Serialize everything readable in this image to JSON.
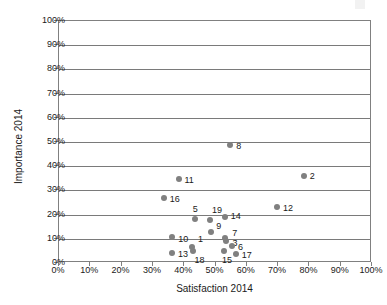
{
  "chart_data": {
    "type": "scatter",
    "title": "",
    "xlabel": "Satisfaction 2014",
    "ylabel": "Importance 2014",
    "xlim": [
      0,
      100
    ],
    "ylim": [
      0,
      100
    ],
    "grid": "horizontal",
    "legend": "none",
    "marker_color": "#808080",
    "xticks": [
      "0%",
      "10%",
      "20%",
      "30%",
      "40%",
      "50%",
      "60%",
      "70%",
      "80%",
      "90%",
      "100%"
    ],
    "xtick_values": [
      0,
      10,
      20,
      30,
      40,
      50,
      60,
      70,
      80,
      90,
      100
    ],
    "yticks": [
      "0%",
      "10%",
      "20%",
      "30%",
      "40%",
      "50%",
      "60%",
      "70%",
      "80%",
      "90%",
      "100%"
    ],
    "ytick_values": [
      0,
      10,
      20,
      30,
      40,
      50,
      60,
      70,
      80,
      90,
      100
    ],
    "points": [
      {
        "label": "1",
        "x": 42.8,
        "y": 6.2,
        "lx": 6,
        "ly": -12
      },
      {
        "label": "2",
        "x": 78.5,
        "y": 35.4,
        "lx": 6,
        "ly": -4
      },
      {
        "label": "3",
        "x": 53.8,
        "y": 8.8,
        "lx": 6,
        "ly": -2
      },
      {
        "label": "5",
        "x": 43.7,
        "y": 17.6,
        "lx": -2,
        "ly": -14
      },
      {
        "label": "6",
        "x": 55.6,
        "y": 6.8,
        "lx": 6,
        "ly": -3
      },
      {
        "label": "7",
        "x": 53.4,
        "y": 10.0,
        "lx": 7,
        "ly": -9
      },
      {
        "label": "8",
        "x": 55.0,
        "y": 48.5,
        "lx": 6,
        "ly": -3
      },
      {
        "label": "9",
        "x": 49.0,
        "y": 12.5,
        "lx": 5,
        "ly": -10
      },
      {
        "label": "10",
        "x": 36.5,
        "y": 10.5,
        "lx": 6,
        "ly": -2
      },
      {
        "label": "11",
        "x": 38.5,
        "y": 34.5,
        "lx": 6,
        "ly": -3
      },
      {
        "label": "12",
        "x": 70.0,
        "y": 22.8,
        "lx": 6,
        "ly": -3
      },
      {
        "label": "13",
        "x": 36.4,
        "y": 3.8,
        "lx": 6,
        "ly": -3
      },
      {
        "label": "14",
        "x": 53.3,
        "y": 18.5,
        "lx": 6,
        "ly": -5
      },
      {
        "label": "15",
        "x": 53.0,
        "y": 4.4,
        "lx": -2,
        "ly": 5
      },
      {
        "label": "16",
        "x": 33.8,
        "y": 26.5,
        "lx": 6,
        "ly": -3
      },
      {
        "label": "17",
        "x": 56.8,
        "y": 3.5,
        "lx": 6,
        "ly": -3
      },
      {
        "label": "18",
        "x": 43.0,
        "y": 4.5,
        "lx": 2,
        "ly": 5
      },
      {
        "label": "19",
        "x": 48.6,
        "y": 17.2,
        "lx": 2,
        "ly": -14
      }
    ]
  }
}
